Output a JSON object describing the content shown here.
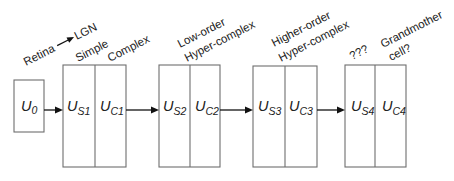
{
  "diagram": {
    "stages": [
      {
        "id": "u0",
        "unit": "U",
        "subscript": "0",
        "labels": [
          "Retina→LGN"
        ]
      },
      {
        "id": "block1",
        "cells": [
          {
            "unit": "U",
            "subscript": "S1"
          },
          {
            "unit": "U",
            "subscript": "C1"
          }
        ],
        "labels": [
          "Simple",
          "Complex"
        ]
      },
      {
        "id": "block2",
        "cells": [
          {
            "unit": "U",
            "subscript": "S2"
          },
          {
            "unit": "U",
            "subscript": "C2"
          }
        ],
        "labels": [
          "Low-order",
          "Hyper-complex"
        ]
      },
      {
        "id": "block3",
        "cells": [
          {
            "unit": "U",
            "subscript": "S3"
          },
          {
            "unit": "U",
            "subscript": "C3"
          }
        ],
        "labels": [
          "Higher-order",
          "Hyper-complex"
        ]
      },
      {
        "id": "block4",
        "cells": [
          {
            "unit": "U",
            "subscript": "S4"
          },
          {
            "unit": "U",
            "subscript": "C4"
          }
        ],
        "labels": [
          "???",
          "Grandmother",
          "cell?"
        ]
      }
    ],
    "annotations": {
      "retina": "Retina",
      "lgn": "LGN",
      "simple": "Simple",
      "complex": "Complex",
      "low_order": "Low-order",
      "hyper_complex_2": "Hyper-complex",
      "higher_order": "Higher-order",
      "hyper_complex_3": "Hyper-complex",
      "unknown": "???",
      "grandmother": "Grandmother",
      "cell": "cell?"
    },
    "units": {
      "u": "U",
      "u0_sub": "0",
      "s1_sub": "S1",
      "c1_sub": "C1",
      "s2_sub": "S2",
      "c2_sub": "C2",
      "s3_sub": "S3",
      "c3_sub": "C3",
      "s4_sub": "S4",
      "c4_sub": "C4"
    },
    "colors": {
      "box_stroke": "#6e6e6e",
      "arrow": "#111111",
      "text": "#222222",
      "background": "#ffffff"
    }
  }
}
